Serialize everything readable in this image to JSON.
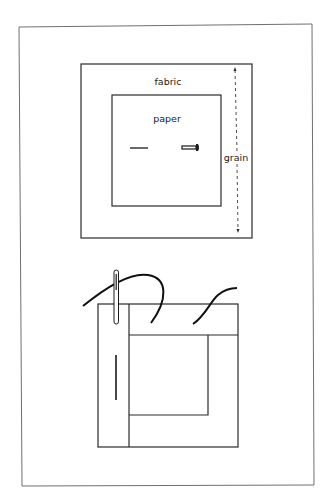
{
  "diagram": {
    "top": {
      "fabric_label": "fabric",
      "paper_label": "paper",
      "grain_label": "grain"
    },
    "colors": {
      "line": "#2a2a2a",
      "frame": "#6e6e6e",
      "background": "#ffffff"
    }
  }
}
